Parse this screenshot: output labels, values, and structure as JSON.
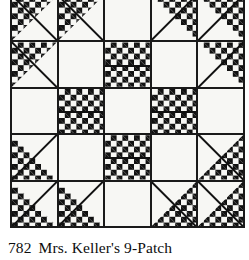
{
  "block": {
    "name": "Mrs. Keller's 9-Patch",
    "number": "782",
    "grid_rows": 5,
    "grid_columns": 5,
    "colors": {
      "background": "#ffffff",
      "patch_light": "#f7f7f4",
      "patch_dot": "#111111",
      "grid_line": "#1a1a1a",
      "caption_text": "#0d0d0d"
    },
    "cells": [
      {
        "row": 1,
        "col": 1,
        "fill": "triangle-top-left",
        "label": "dotted triangle upper-left"
      },
      {
        "row": 1,
        "col": 2,
        "fill": "triangle-top-left",
        "label": "dotted triangle upper-left"
      },
      {
        "row": 1,
        "col": 3,
        "fill": "plain",
        "label": "plain light square"
      },
      {
        "row": 1,
        "col": 4,
        "fill": "triangle-top-right",
        "label": "dotted triangle upper-right"
      },
      {
        "row": 1,
        "col": 5,
        "fill": "triangle-top-right",
        "label": "dotted triangle upper-right"
      },
      {
        "row": 2,
        "col": 1,
        "fill": "triangle-top-left",
        "label": "dotted triangle upper-left"
      },
      {
        "row": 2,
        "col": 2,
        "fill": "plain",
        "label": "plain light square"
      },
      {
        "row": 2,
        "col": 3,
        "fill": "dotted",
        "label": "dotted square"
      },
      {
        "row": 2,
        "col": 4,
        "fill": "plain",
        "label": "plain light square"
      },
      {
        "row": 2,
        "col": 5,
        "fill": "triangle-top-right",
        "label": "dotted triangle upper-right"
      },
      {
        "row": 3,
        "col": 1,
        "fill": "plain",
        "label": "plain light square"
      },
      {
        "row": 3,
        "col": 2,
        "fill": "dotted",
        "label": "dotted square"
      },
      {
        "row": 3,
        "col": 3,
        "fill": "plain",
        "label": "plain light square"
      },
      {
        "row": 3,
        "col": 4,
        "fill": "dotted",
        "label": "dotted square"
      },
      {
        "row": 3,
        "col": 5,
        "fill": "plain",
        "label": "plain light square"
      },
      {
        "row": 4,
        "col": 1,
        "fill": "triangle-bottom-left",
        "label": "dotted triangle lower-left"
      },
      {
        "row": 4,
        "col": 2,
        "fill": "plain",
        "label": "plain light square"
      },
      {
        "row": 4,
        "col": 3,
        "fill": "dotted",
        "label": "dotted square"
      },
      {
        "row": 4,
        "col": 4,
        "fill": "plain",
        "label": "plain light square"
      },
      {
        "row": 4,
        "col": 5,
        "fill": "triangle-bottom-right",
        "label": "dotted triangle lower-right"
      },
      {
        "row": 5,
        "col": 1,
        "fill": "triangle-bottom-left",
        "label": "dotted triangle lower-left"
      },
      {
        "row": 5,
        "col": 2,
        "fill": "triangle-bottom-left",
        "label": "dotted triangle lower-left"
      },
      {
        "row": 5,
        "col": 3,
        "fill": "plain",
        "label": "plain light square"
      },
      {
        "row": 5,
        "col": 4,
        "fill": "triangle-bottom-right",
        "label": "dotted triangle lower-right"
      },
      {
        "row": 5,
        "col": 5,
        "fill": "triangle-bottom-right",
        "label": "dotted triangle lower-right"
      }
    ]
  },
  "caption": {
    "number": "782",
    "title": "Mrs. Keller's 9-Patch"
  }
}
